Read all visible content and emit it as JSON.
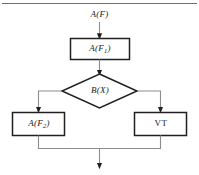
{
  "figure": {
    "type": "flowchart",
    "orientation": "top-to-bottom",
    "top_rule": true,
    "colors": {
      "node_border": "#231f20",
      "connector": "#8c8c8c",
      "arrowhead": "#231f20",
      "node_fill": "#ffffff",
      "text": "#1a1a1a",
      "rule": "#6f6f6f"
    },
    "entry": {
      "label_base": "A",
      "label_paren": "(F)",
      "label_full": "A(F)"
    },
    "nodes": [
      {
        "id": "proc1",
        "shape": "rectangle",
        "label_base": "A",
        "label_open": "(F",
        "label_sub": "1",
        "label_close": ")",
        "label_full": "A(F1)"
      },
      {
        "id": "decision",
        "shape": "diamond",
        "label_base": "B",
        "label_paren": "(X)",
        "label_full": "B(X)"
      },
      {
        "id": "proc2",
        "shape": "rectangle",
        "label_base": "A",
        "label_open": "(F",
        "label_sub": "2",
        "label_close": ")",
        "label_full": "A(F2)"
      },
      {
        "id": "terminal",
        "shape": "rectangle",
        "label_full": "VT"
      }
    ],
    "edges": [
      {
        "from": "entry",
        "to": "proc1",
        "style": "straight-down",
        "arrow": true
      },
      {
        "from": "proc1",
        "to": "decision",
        "style": "straight-down",
        "arrow": true
      },
      {
        "from": "decision",
        "to": "proc2",
        "style": "left-then-down",
        "arrow": true
      },
      {
        "from": "decision",
        "to": "terminal",
        "style": "right-then-down",
        "arrow": true
      },
      {
        "from": "proc2",
        "to": "merge",
        "style": "down-then-right",
        "arrow": false
      },
      {
        "from": "terminal",
        "to": "merge",
        "style": "down-then-left",
        "arrow": false
      },
      {
        "from": "merge",
        "to": "exit",
        "style": "straight-down",
        "arrow": true
      }
    ]
  }
}
